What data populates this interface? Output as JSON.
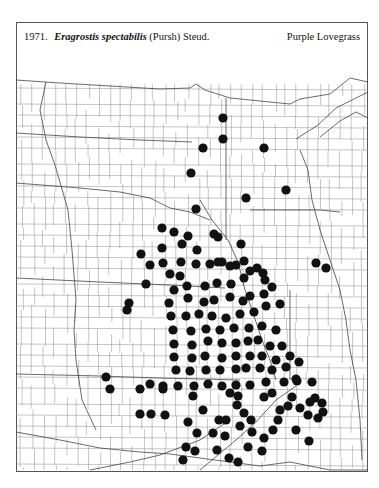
{
  "header": {
    "number": "1971.",
    "scientific_name": "Eragrostis spectabilis",
    "authority": "(Pursh) Steud.",
    "common_name": "Purple Lovegrass"
  },
  "map": {
    "region": "North-central / central United States county map",
    "marker_color": "#111111",
    "line_color": "#777777",
    "state_line_color": "#444444",
    "dot_radius": 4.6,
    "dots": [
      [
        223,
        118
      ],
      [
        223,
        139
      ],
      [
        203,
        148
      ],
      [
        264,
        148
      ],
      [
        191,
        173
      ],
      [
        286,
        190
      ],
      [
        246,
        198
      ],
      [
        196,
        209
      ],
      [
        162,
        228
      ],
      [
        174,
        232
      ],
      [
        188,
        236
      ],
      [
        214,
        234
      ],
      [
        218,
        237
      ],
      [
        241,
        244
      ],
      [
        141,
        254
      ],
      [
        162,
        248
      ],
      [
        182,
        244
      ],
      [
        197,
        250
      ],
      [
        316,
        263
      ],
      [
        326,
        268
      ],
      [
        244,
        261
      ],
      [
        222,
        262
      ],
      [
        236,
        265
      ],
      [
        257,
        268
      ],
      [
        129,
        303
      ],
      [
        127,
        310
      ],
      [
        146,
        284
      ],
      [
        163,
        263
      ],
      [
        181,
        262
      ],
      [
        150,
        265
      ],
      [
        170,
        274
      ],
      [
        180,
        276
      ],
      [
        196,
        264
      ],
      [
        210,
        264
      ],
      [
        218,
        262
      ],
      [
        230,
        266
      ],
      [
        250,
        271
      ],
      [
        263,
        273
      ],
      [
        174,
        290
      ],
      [
        187,
        286
      ],
      [
        205,
        286
      ],
      [
        217,
        283
      ],
      [
        231,
        284
      ],
      [
        244,
        278
      ],
      [
        265,
        280
      ],
      [
        272,
        287
      ],
      [
        169,
        303
      ],
      [
        188,
        298
      ],
      [
        204,
        302
      ],
      [
        214,
        300
      ],
      [
        230,
        297
      ],
      [
        243,
        301
      ],
      [
        250,
        296
      ],
      [
        264,
        294
      ],
      [
        171,
        316
      ],
      [
        186,
        316
      ],
      [
        199,
        314
      ],
      [
        212,
        316
      ],
      [
        226,
        318
      ],
      [
        240,
        314
      ],
      [
        254,
        312
      ],
      [
        266,
        306
      ],
      [
        280,
        304
      ],
      [
        173,
        330
      ],
      [
        191,
        331
      ],
      [
        206,
        329
      ],
      [
        220,
        330
      ],
      [
        234,
        328
      ],
      [
        249,
        328
      ],
      [
        262,
        326
      ],
      [
        276,
        330
      ],
      [
        174,
        344
      ],
      [
        192,
        345
      ],
      [
        208,
        341
      ],
      [
        222,
        343
      ],
      [
        236,
        343
      ],
      [
        248,
        341
      ],
      [
        258,
        340
      ],
      [
        270,
        346
      ],
      [
        282,
        346
      ],
      [
        174,
        357
      ],
      [
        192,
        358
      ],
      [
        205,
        356
      ],
      [
        222,
        358
      ],
      [
        236,
        356
      ],
      [
        250,
        356
      ],
      [
        262,
        356
      ],
      [
        276,
        360
      ],
      [
        290,
        356
      ],
      [
        176,
        370
      ],
      [
        190,
        371
      ],
      [
        206,
        370
      ],
      [
        220,
        370
      ],
      [
        236,
        369
      ],
      [
        246,
        368
      ],
      [
        260,
        368
      ],
      [
        272,
        370
      ],
      [
        286,
        367
      ],
      [
        299,
        362
      ],
      [
        163,
        386
      ],
      [
        178,
        386
      ],
      [
        194,
        386
      ],
      [
        208,
        384
      ],
      [
        222,
        386
      ],
      [
        236,
        385
      ],
      [
        250,
        385
      ],
      [
        266,
        382
      ],
      [
        284,
        382
      ],
      [
        297,
        381
      ],
      [
        106,
        377
      ],
      [
        110,
        389
      ],
      [
        140,
        389
      ],
      [
        150,
        384
      ],
      [
        163,
        389
      ],
      [
        193,
        396
      ],
      [
        230,
        393
      ],
      [
        238,
        396
      ],
      [
        264,
        397
      ],
      [
        272,
        393
      ],
      [
        296,
        379
      ],
      [
        312,
        382
      ],
      [
        315,
        398
      ],
      [
        322,
        403
      ],
      [
        310,
        402
      ],
      [
        323,
        412
      ],
      [
        308,
        415
      ],
      [
        318,
        418
      ],
      [
        140,
        414
      ],
      [
        151,
        414
      ],
      [
        165,
        415
      ],
      [
        203,
        410
      ],
      [
        237,
        405
      ],
      [
        244,
        413
      ],
      [
        226,
        420
      ],
      [
        251,
        420
      ],
      [
        188,
        422
      ],
      [
        197,
        433
      ],
      [
        213,
        433
      ],
      [
        219,
        420
      ],
      [
        225,
        436
      ],
      [
        240,
        426
      ],
      [
        252,
        432
      ],
      [
        264,
        438
      ],
      [
        273,
        430
      ],
      [
        292,
        397
      ],
      [
        288,
        406
      ],
      [
        280,
        410
      ],
      [
        278,
        420
      ],
      [
        300,
        408
      ],
      [
        296,
        430
      ],
      [
        309,
        441
      ],
      [
        186,
        447
      ],
      [
        183,
        460
      ],
      [
        195,
        451
      ],
      [
        217,
        450
      ],
      [
        229,
        458
      ],
      [
        238,
        462
      ],
      [
        248,
        447
      ],
      [
        262,
        451
      ]
    ]
  }
}
